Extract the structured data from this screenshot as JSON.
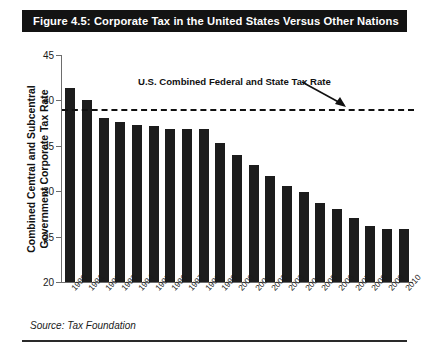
{
  "figure": {
    "title": "Figure 4.5: Corporate Tax in the United States Versus Other Nations",
    "source": "Source: Tax Foundation",
    "title_bar_color": "#131313",
    "bar_color": "#1c1c1c"
  },
  "chart_data": {
    "type": "bar",
    "title": "Figure 4.5: Corporate Tax in the United States Versus Other Nations",
    "xlabel": "",
    "ylabel": "Combined Central and Subcentral Government Corporate Tax Rate",
    "ylim": [
      20,
      45
    ],
    "yticks": [
      20,
      25,
      30,
      35,
      40,
      45
    ],
    "grid": false,
    "legend": "none",
    "categories": [
      "1990",
      "1991",
      "1992",
      "1993",
      "1994",
      "1995",
      "1996",
      "1997",
      "1998",
      "1999",
      "2000",
      "2001",
      "2002",
      "2003",
      "2004",
      "2005",
      "2006",
      "2007",
      "2008",
      "2009",
      "2010"
    ],
    "values": [
      41.4,
      40.0,
      38.1,
      37.6,
      37.3,
      37.2,
      36.9,
      36.8,
      36.8,
      35.3,
      34.0,
      32.9,
      31.7,
      30.6,
      29.9,
      28.7,
      28.0,
      27.1,
      26.2,
      25.8,
      25.8
    ],
    "annotations": [
      {
        "text": "U.S. Combined Federal and State Tax Rate",
        "type": "reference-line-label",
        "arrow": true
      }
    ],
    "reference_line": {
      "label": "U.S. Combined Federal and State Tax Rate",
      "value": 39.0,
      "style": "dashed"
    }
  },
  "ylabel_lines": [
    "Combined Central and Subcentral",
    "Government Corporate Tax Rate"
  ]
}
